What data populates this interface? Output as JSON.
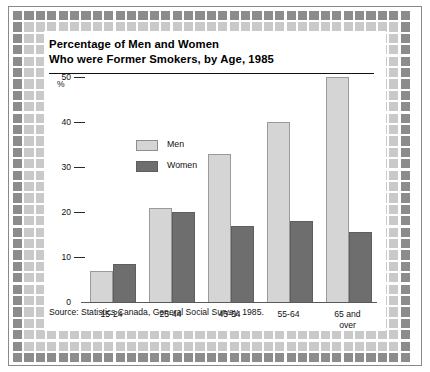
{
  "chart_data": {
    "type": "bar",
    "title": "Percentage of Men and Women Who were Former Smokers, by Age, 1985",
    "title_line1": "Percentage of Men and Women",
    "title_line2": "Who were Former Smokers, by Age, 1985",
    "xlabel": "",
    "ylabel": "%",
    "ylim": [
      0,
      50
    ],
    "yticks": [
      0,
      10,
      20,
      30,
      40,
      50
    ],
    "ytick_labels": [
      "0",
      "10",
      "20",
      "30",
      "40",
      "50"
    ],
    "grid": false,
    "legend_position": "upper-left-inside",
    "categories": [
      "15-24",
      "25-44",
      "45-54",
      "55-64",
      "65 and over"
    ],
    "category_labels_wrapped": [
      [
        "15-24"
      ],
      [
        "25-44"
      ],
      [
        "45-54"
      ],
      [
        "55-64"
      ],
      [
        "65 and",
        "over"
      ]
    ],
    "series": [
      {
        "name": "Men",
        "color": "#d5d5d5",
        "values": [
          7,
          21,
          33,
          40,
          50
        ]
      },
      {
        "name": "Women",
        "color": "#6e6e6e",
        "values": [
          8.5,
          20,
          17,
          18,
          15.5
        ]
      }
    ],
    "source": "Source: Statistics Canada, General Social Survey, 1985.",
    "annotations": []
  },
  "frame": {
    "dark_square_color": "#8c8c8c",
    "light_square_color": "#c9c9c9",
    "panel_background": "#ffffff",
    "rule_color": "#8a8a8a"
  }
}
